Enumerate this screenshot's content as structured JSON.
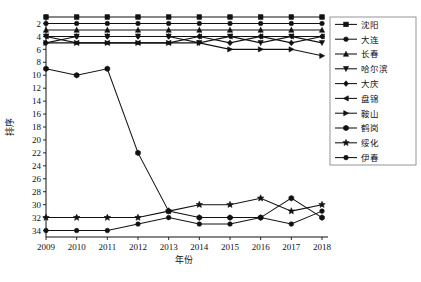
{
  "chart_data": {
    "type": "line",
    "title": "",
    "xlabel": "年份",
    "ylabel": "排序",
    "x": [
      2009,
      2010,
      2011,
      2012,
      2013,
      2014,
      2015,
      2016,
      2017,
      2018
    ],
    "xtick_labels": [
      "2009",
      "2010",
      "2011",
      "2012",
      "2013",
      "2014",
      "2015",
      "2016",
      "2017",
      "2018"
    ],
    "ytick_labels": [
      "2",
      "4",
      "6",
      "8",
      "10",
      "12",
      "14",
      "16",
      "18",
      "20",
      "22",
      "24",
      "26",
      "28",
      "30",
      "32",
      "34"
    ],
    "ylim": [
      1,
      35
    ],
    "y_inverted": true,
    "grid": false,
    "legend_position": "right",
    "series": [
      {
        "name": "沈阳",
        "marker": "square",
        "values": [
          1,
          1,
          1,
          1,
          1,
          1,
          1,
          1,
          1,
          1
        ]
      },
      {
        "name": "大连",
        "marker": "circle",
        "values": [
          2,
          2,
          2,
          2,
          2,
          2,
          2,
          2,
          2,
          2
        ]
      },
      {
        "name": "长春",
        "marker": "triangle-up",
        "values": [
          3,
          3,
          3,
          3,
          3,
          3,
          3,
          3,
          3,
          3
        ]
      },
      {
        "name": "哈尔滨",
        "marker": "triangle-down",
        "values": [
          4,
          4,
          4,
          4,
          4,
          5,
          4,
          5,
          4,
          5
        ]
      },
      {
        "name": "大庆",
        "marker": "diamond",
        "values": [
          5,
          4,
          4,
          4,
          4,
          4,
          5,
          4,
          5,
          4
        ]
      },
      {
        "name": "盘锦",
        "marker": "triangle-left",
        "values": [
          4,
          5,
          5,
          5,
          5,
          4,
          4,
          4,
          4,
          4
        ]
      },
      {
        "name": "鞍山",
        "marker": "triangle-right",
        "values": [
          5,
          5,
          5,
          5,
          5,
          5,
          6,
          6,
          6,
          7
        ]
      },
      {
        "name": "鹤岗",
        "marker": "hexagon",
        "values": [
          9,
          10,
          9,
          22,
          31,
          32,
          32,
          32,
          29,
          32
        ]
      },
      {
        "name": "绥化",
        "marker": "star",
        "values": [
          32,
          32,
          32,
          32,
          31,
          30,
          30,
          29,
          31,
          30
        ]
      },
      {
        "name": "伊春",
        "marker": "circle-filled",
        "values": [
          34,
          34,
          34,
          33,
          32,
          33,
          33,
          32,
          33,
          31
        ]
      }
    ]
  },
  "legend": {
    "items": [
      {
        "label": "沈阳"
      },
      {
        "label": "大连"
      },
      {
        "label": "长春"
      },
      {
        "label": "哈尔滨"
      },
      {
        "label": "大庆"
      },
      {
        "label": "盘锦"
      },
      {
        "label": "鞍山"
      },
      {
        "label": "鹤岗"
      },
      {
        "label": "绥化"
      },
      {
        "label": "伊春"
      }
    ]
  },
  "axes": {
    "x_title": "年份",
    "y_title": "排序",
    "xticks": [
      "2009",
      "2010",
      "2011",
      "2012",
      "2013",
      "2014",
      "2015",
      "2016",
      "2017",
      "2018"
    ],
    "yticks": [
      "2",
      "4",
      "6",
      "8",
      "10",
      "12",
      "14",
      "16",
      "18",
      "20",
      "22",
      "24",
      "26",
      "28",
      "30",
      "32",
      "34"
    ]
  },
  "caption": {
    "text": ""
  },
  "colors": {
    "line": "#111111",
    "axis": "#111111",
    "background": "#ffffff",
    "legend_border": "#8a8a8a"
  }
}
